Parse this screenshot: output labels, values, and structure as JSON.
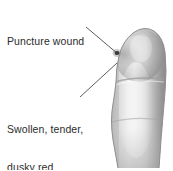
{
  "figure": {
    "background_color": "#ffffff",
    "width": 173,
    "height": 170
  },
  "labels": {
    "puncture": {
      "text": "Puncture wound",
      "color": "#2b2b2b"
    },
    "swollen": {
      "line1": "Swollen, tender,",
      "line2": "dusky red",
      "color": "#2b2b2b"
    }
  },
  "leader_lines": [
    {
      "name": "leader-puncture",
      "from": [
        86,
        27
      ],
      "to": [
        118,
        54
      ],
      "color": "#4a4a4a"
    },
    {
      "name": "leader-swollen",
      "from": [
        80,
        97
      ],
      "to": [
        117,
        63
      ],
      "color": "#4a4a4a"
    }
  ],
  "illustration": {
    "subject": "finger",
    "style": "grayscale-medical-drawing",
    "skin_light": "#e8e8e8",
    "skin_mid": "#c9c9c9",
    "skin_shadow": "#9a9a9a",
    "skin_dark": "#7d7d7d",
    "outline": "#8a8a8a",
    "wound_color": "#3a3a3a",
    "wound_position": [
      117,
      53
    ],
    "wound_radius": 2.4,
    "joint_crease_y": 80
  }
}
